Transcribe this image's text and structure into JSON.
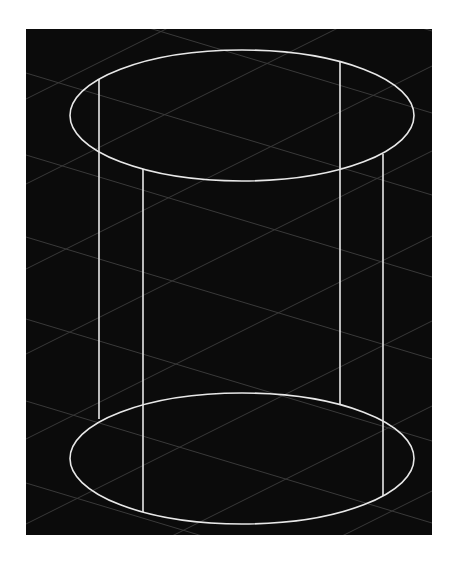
{
  "viewport": {
    "background": "#0b0b0b",
    "grid_color": "#3a3a3a",
    "wire_color": "#e8e8e8"
  },
  "cylinder": {
    "top_ellipse": {
      "cx": 216,
      "cy": 86.5,
      "rx": 172,
      "ry": 65.5
    },
    "bottom_ellipse": {
      "cx": 216,
      "cy": 429.5,
      "rx": 172,
      "ry": 65.5
    },
    "edges": [
      {
        "x": 73,
        "y1": 50,
        "y2": 390
      },
      {
        "x": 117,
        "y1": 140,
        "y2": 483
      },
      {
        "x": 314,
        "y1": 32,
        "y2": 375
      },
      {
        "x": 357,
        "y1": 125,
        "y2": 467
      }
    ]
  }
}
